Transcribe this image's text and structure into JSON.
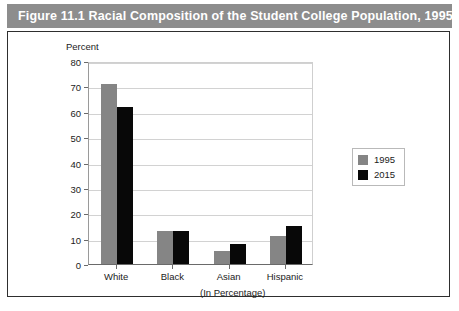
{
  "figure": {
    "title": "Figure 11.1  Racial Composition of the Student College Population, 1995-2015",
    "title_band_color": "#8d8d8d",
    "frame_border_color": "#2e2e2e"
  },
  "chart_data": {
    "type": "bar",
    "title": "Figure 11.1  Racial Composition of the Student College Population, 1995-2015",
    "xlabel": "(In Percentage)",
    "ylabel": "Percent",
    "categories": [
      "White",
      "Black",
      "Asian",
      "Hispanic"
    ],
    "series": [
      {
        "name": "1995",
        "color": "#858585",
        "values": [
          71,
          13,
          5,
          11
        ]
      },
      {
        "name": "2015",
        "color": "#080808",
        "values": [
          62,
          13,
          8,
          15
        ]
      }
    ],
    "ylim": [
      0,
      80
    ],
    "ytick_step": 10,
    "yticks": [
      0,
      10,
      20,
      30,
      40,
      50,
      60,
      70,
      80
    ],
    "ytick_labels": [
      "0",
      "10",
      "20",
      "30",
      "40",
      "50",
      "60",
      "70",
      "80"
    ],
    "grid": true,
    "grid_axis": "y",
    "legend_position": "right"
  },
  "legend": {
    "entries": [
      {
        "label": "1995"
      },
      {
        "label": "2015"
      }
    ]
  }
}
